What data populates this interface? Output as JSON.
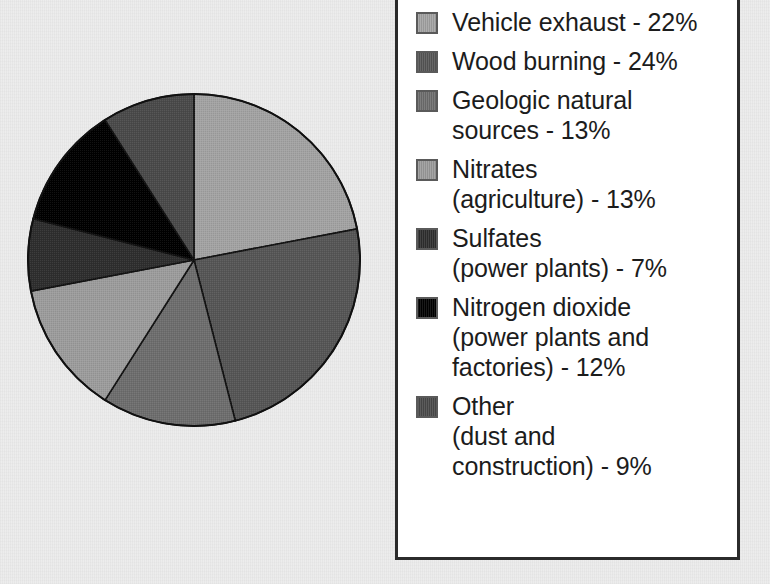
{
  "chart_data": {
    "type": "pie",
    "title": "",
    "subtitle": "",
    "xlabel": "",
    "ylabel": "",
    "legend_position": "right",
    "grid": false,
    "start_angle_deg": 0,
    "direction": "clockwise",
    "unit": "%",
    "categories": [
      "Vehicle exhaust",
      "Wood burning",
      "Geologic natural sources",
      "Nitrates (agriculture)",
      "Sulfates (power plants)",
      "Nitrogen dioxide (power plants and factories)",
      "Other (dust and construction)"
    ],
    "values": [
      22,
      24,
      13,
      13,
      7,
      12,
      9
    ],
    "total": 100,
    "colors": [
      "#a3a3a3",
      "#565656",
      "#6e6e6e",
      "#9c9c9c",
      "#2e2e2e",
      "#000000",
      "#4a4a4a"
    ],
    "slices": [
      {
        "label": "Vehicle exhaust",
        "value": 22,
        "color": "#a3a3a3"
      },
      {
        "label": "Wood burning",
        "value": 24,
        "color": "#565656"
      },
      {
        "label": "Geologic natural sources",
        "value": 13,
        "color": "#6e6e6e"
      },
      {
        "label": "Nitrates (agriculture)",
        "value": 13,
        "color": "#9c9c9c"
      },
      {
        "label": "Sulfates (power plants)",
        "value": 7,
        "color": "#2e2e2e"
      },
      {
        "label": "Nitrogen dioxide (power plants and factories)",
        "value": 12,
        "color": "#000000"
      },
      {
        "label": "Other (dust and construction)",
        "value": 9,
        "color": "#4a4a4a"
      }
    ]
  },
  "legend": {
    "items": [
      {
        "text": "Vehicle exhaust - 22%",
        "color": "#a3a3a3"
      },
      {
        "text": "Wood burning - 24%",
        "color": "#565656"
      },
      {
        "text": "Geologic natural\nsources - 13%",
        "color": "#6e6e6e"
      },
      {
        "text": "Nitrates\n(agriculture) - 13%",
        "color": "#9c9c9c"
      },
      {
        "text": "Sulfates\n(power plants) - 7%",
        "color": "#2e2e2e"
      },
      {
        "text": "Nitrogen dioxide\n(power plants and\nfactories) - 12%",
        "color": "#000000"
      },
      {
        "text": "Other\n(dust and\nconstruction) - 9%",
        "color": "#4a4a4a"
      }
    ]
  },
  "style": {
    "page_background": "#ececec",
    "legend_background": "#ffffff",
    "legend_border": "#2b2b2b",
    "slice_outline": "#111111",
    "text_color": "#1c1c1c"
  }
}
